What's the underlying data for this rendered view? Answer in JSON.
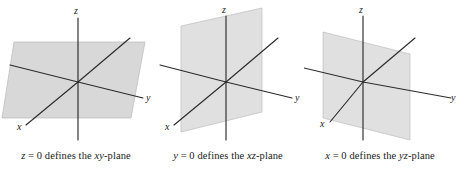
{
  "figure": {
    "panel_count": 3,
    "background_color": "#ffffff",
    "plane_fill_color": "#d6d6d6",
    "axis_color": "#2b2b2b",
    "text_color": "#1a1a1a"
  },
  "panels": [
    {
      "id": "xy-plane",
      "caption": "z = 0 defines the xy-plane",
      "caption_parts": {
        "variable": "z",
        "equation": "= 0 defines the",
        "plane_name": "xy",
        "plane_suffix": "-plane"
      },
      "axis_labels": {
        "x": "x",
        "y": "y",
        "z": "z"
      },
      "plane_orientation": "horizontal"
    },
    {
      "id": "xz-plane",
      "caption": "y = 0 defines the xz-plane",
      "caption_parts": {
        "variable": "y",
        "equation": "= 0 defines the",
        "plane_name": "xz",
        "plane_suffix": "-plane"
      },
      "axis_labels": {
        "x": "x",
        "y": "y",
        "z": "z"
      },
      "plane_orientation": "vertical-along-x"
    },
    {
      "id": "yz-plane",
      "caption": "x = 0 defines the yz-plane",
      "caption_parts": {
        "variable": "x",
        "equation": "= 0 defines the",
        "plane_name": "yz",
        "plane_suffix": "-plane"
      },
      "axis_labels": {
        "x": "x",
        "y": "y",
        "z": "z"
      },
      "plane_orientation": "vertical-along-y"
    }
  ]
}
